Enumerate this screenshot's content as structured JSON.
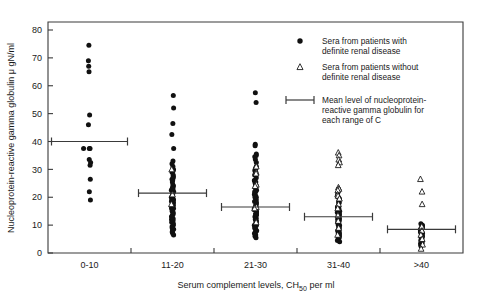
{
  "chart_data": {
    "type": "scatter",
    "title": "",
    "xlabel": "Serum complement levels, CH50 per ml",
    "xlabel_main": "Serum complement levels, CH",
    "xlabel_sub": "50",
    "xlabel_tail": " per ml",
    "ylabel": "Nucleoprotein-reactive gamma globulin μ gN/ml",
    "ylim": [
      0,
      80
    ],
    "yticks": [
      0,
      10,
      20,
      30,
      40,
      50,
      60,
      70,
      80
    ],
    "categories": [
      "0-10",
      "11-20",
      "21-30",
      "31-40",
      ">40"
    ],
    "grid": false,
    "legend_position": "upper-right-inside",
    "series": [
      {
        "name": "Sera from patients with definite renal disease",
        "marker": "filled-circle",
        "color": "#111111"
      },
      {
        "name": "Sera from patients without definite renal disease",
        "marker": "open-triangle",
        "color": "#111111"
      },
      {
        "name": "Mean level of nucleoprotein-reactive gamma globulin for each range of C",
        "marker": "error-bar",
        "color": "#3a3a3a"
      }
    ],
    "means": [
      40.0,
      21.5,
      16.5,
      13.0,
      8.5
    ],
    "groups": [
      {
        "category": "0-10",
        "circles": [
          74.5,
          69.0,
          67.0,
          65.0,
          49.5,
          46.0,
          37.5,
          37.5,
          37.5,
          33.5,
          32.5,
          31.5,
          26.5,
          22.0,
          19.0
        ],
        "triangles": []
      },
      {
        "category": "11-20",
        "circles": [
          56.5,
          52.0,
          46.5,
          42.5,
          37.5,
          33.0,
          32.0,
          31.0,
          30.0,
          29.0,
          28.0,
          27.5,
          27.0,
          26.5,
          25.5,
          24.5,
          24.0,
          23.5,
          23.0,
          22.5,
          22.0,
          21.5,
          21.0,
          20.5,
          20.0,
          19.5,
          19.0,
          18.5,
          18.0,
          17.5,
          17.0,
          16.5,
          16.0,
          15.5,
          15.0,
          14.5,
          14.0,
          13.5,
          13.0,
          12.5,
          12.0,
          11.5,
          11.0,
          10.5,
          10.0,
          9.5,
          9.0,
          8.5,
          8.0,
          7.5,
          7.0,
          6.5,
          29.5,
          26.0,
          23.0,
          19.0,
          16.0,
          12.0
        ],
        "triangles": [
          30.0,
          21.0,
          17.5
        ]
      },
      {
        "category": "21-30",
        "circles": [
          57.5,
          54.0,
          39.0,
          38.5,
          35.5,
          35.0,
          34.5,
          33.5,
          32.5,
          31.0,
          30.5,
          30.0,
          29.5,
          29.0,
          28.0,
          27.0,
          26.0,
          25.5,
          25.0,
          24.5,
          24.0,
          23.5,
          23.0,
          22.5,
          22.0,
          21.5,
          21.0,
          20.5,
          20.0,
          19.5,
          19.0,
          18.5,
          18.0,
          17.5,
          17.0,
          16.5,
          16.0,
          15.5,
          15.0,
          14.5,
          14.0,
          13.5,
          13.0,
          12.5,
          12.0,
          11.5,
          11.0,
          10.5,
          10.0,
          9.5,
          9.0,
          8.5,
          8.0,
          7.5,
          7.0,
          6.5,
          6.0,
          5.5,
          18.0,
          16.0,
          14.0,
          12.0,
          10.0,
          22.0,
          20.0,
          24.0,
          26.0,
          9.0,
          7.0
        ],
        "triangles": [
          31.0,
          29.0,
          28.5,
          24.5,
          24.0,
          16.5,
          16.0,
          11.0
        ]
      },
      {
        "category": "31-40",
        "circles": [
          23.0,
          21.5,
          20.5,
          19.5,
          18.5,
          18.0,
          17.0,
          16.5,
          16.0,
          15.5,
          15.0,
          14.5,
          14.0,
          13.5,
          13.0,
          12.5,
          12.0,
          11.5,
          11.0,
          10.5,
          10.0,
          9.5,
          9.0,
          8.5,
          8.0,
          7.5,
          7.0,
          6.5,
          6.0,
          5.5,
          5.0,
          4.5,
          4.0,
          16.0,
          14.0,
          12.0,
          10.0,
          8.0,
          6.0,
          18.0,
          20.0,
          13.0,
          11.0,
          9.0,
          7.0
        ],
        "triangles": [
          36.0,
          35.0,
          33.5,
          32.5,
          31.5,
          23.5,
          23.0,
          22.5,
          21.0,
          20.5,
          19.5,
          17.5,
          16.0,
          13.5,
          11.5,
          9.0,
          6.5
        ]
      },
      {
        "category": ">40",
        "circles": [
          10.5,
          10.0,
          9.5,
          9.0,
          8.5,
          8.0,
          7.5,
          7.0,
          6.5,
          6.0,
          5.5,
          5.0,
          4.5,
          4.0,
          3.5,
          3.0,
          9.0,
          8.0,
          7.0,
          6.0,
          5.0,
          4.0,
          8.5,
          7.5,
          6.5,
          5.5,
          4.5,
          3.5,
          2.5
        ],
        "triangles": [
          26.5,
          22.0,
          17.5,
          9.5,
          8.0,
          6.5,
          5.0,
          3.0,
          1.5
        ]
      }
    ]
  },
  "legend": {
    "entries": [
      {
        "marker": "filled-circle",
        "line1": "Sera from patients with",
        "line2": "definite renal disease",
        "line3": ""
      },
      {
        "marker": "open-triangle",
        "line1": "Sera from patients without",
        "line2": "definite renal disease",
        "line3": ""
      },
      {
        "marker": "error-bar",
        "line1": "Mean level of nucleoprotein-",
        "line2": "reactive gamma globulin for",
        "line3": "each range of C"
      }
    ]
  }
}
